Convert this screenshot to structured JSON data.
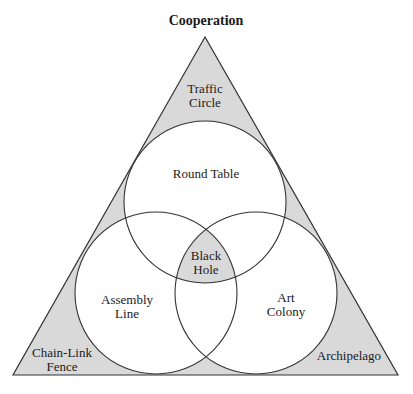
{
  "diagram": {
    "title": "Cooperation",
    "colors": {
      "shade": "#d9d9d9",
      "line": "#333333",
      "background": "#ffffff"
    },
    "circles": [
      {
        "id": "top",
        "label": "Round Table"
      },
      {
        "id": "left",
        "label_line1": "Assembly",
        "label_line2": "Line"
      },
      {
        "id": "right",
        "label_line1": "Art",
        "label_line2": "Colony"
      }
    ],
    "center": {
      "label_line1": "Black",
      "label_line2": "Hole"
    },
    "corners": {
      "top": {
        "label_line1": "Traffic",
        "label_line2": "Circle"
      },
      "left": {
        "label_line1": "Chain-Link",
        "label_line2": "Fence"
      },
      "right": {
        "label": "Archipelago"
      }
    }
  }
}
